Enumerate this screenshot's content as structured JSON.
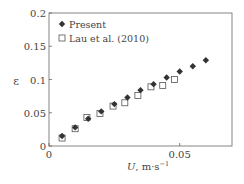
{
  "chart_data": {
    "type": "scatter",
    "title": "",
    "xlabel": "U, m·s⁻¹",
    "xlabel_var": "U",
    "xlabel_unit": ", m·s",
    "xlabel_exp": "−1",
    "ylabel": "ε",
    "xlim": [
      0,
      0.07
    ],
    "ylim": [
      0,
      0.2
    ],
    "x_ticks": [
      {
        "v": 0,
        "label": "0"
      },
      {
        "v": 0.05,
        "label": "0.05"
      }
    ],
    "y_ticks": [
      {
        "v": 0,
        "label": "0"
      },
      {
        "v": 0.05,
        "label": "0.05"
      },
      {
        "v": 0.1,
        "label": "0.1"
      },
      {
        "v": 0.15,
        "label": "0.15"
      },
      {
        "v": 0.2,
        "label": "0.2"
      }
    ],
    "grid": false,
    "legend_position": "upper left",
    "series": [
      {
        "name": "Present",
        "marker": "filled-diamond",
        "color": "#333333",
        "points": [
          [
            0.005,
            0.015
          ],
          [
            0.01,
            0.028
          ],
          [
            0.015,
            0.041
          ],
          [
            0.02,
            0.052
          ],
          [
            0.025,
            0.063
          ],
          [
            0.03,
            0.073
          ],
          [
            0.035,
            0.084
          ],
          [
            0.04,
            0.093
          ],
          [
            0.045,
            0.103
          ],
          [
            0.05,
            0.112
          ],
          [
            0.055,
            0.12
          ],
          [
            0.06,
            0.129
          ]
        ]
      },
      {
        "name": "Lau et al. (2010)",
        "marker": "open-square",
        "color": "#555555",
        "points": [
          [
            0.005,
            0.012
          ],
          [
            0.01,
            0.026
          ],
          [
            0.0145,
            0.043
          ],
          [
            0.0195,
            0.049
          ],
          [
            0.0245,
            0.06
          ],
          [
            0.029,
            0.065
          ],
          [
            0.034,
            0.076
          ],
          [
            0.039,
            0.089
          ],
          [
            0.0435,
            0.091
          ],
          [
            0.048,
            0.1
          ]
        ]
      }
    ]
  }
}
